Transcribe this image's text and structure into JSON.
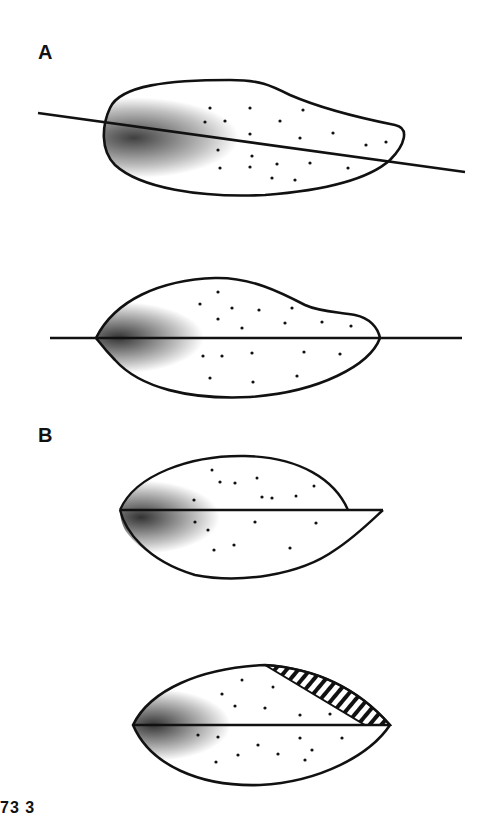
{
  "figure": {
    "panels": [
      {
        "label": "A",
        "drawings": [
          {
            "name": "seed-oblique-section",
            "description": "Irregular ovoid outline with stippled shading, darker at left end, cut by an oblique line"
          },
          {
            "name": "seed-horizontal-section",
            "description": "Asymmetric ovoid outline with stippling, darker at left, bisected by a horizontal line extending beyond both ends"
          }
        ]
      },
      {
        "label": "B",
        "drawings": [
          {
            "name": "seed-split-offset",
            "description": "Ovoid with horizontal midline; lower half extends to a pointed tip beyond the upper half"
          },
          {
            "name": "seed-split-hatched",
            "description": "Lenticular shape with horizontal midline; upper-right segment hatched with diagonal lines"
          }
        ]
      }
    ],
    "figure_number_partial": "73  3",
    "colors": {
      "ink": "#111111",
      "background": "#ffffff",
      "stipple_dark": "#222222"
    }
  }
}
